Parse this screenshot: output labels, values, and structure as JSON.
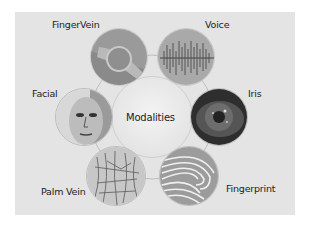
{
  "diagram": {
    "center": {
      "label": "Modalities"
    },
    "nodes": [
      {
        "id": "finger-vein",
        "label": "FingerVein",
        "image": "finger-vein-scan"
      },
      {
        "id": "voice",
        "label": "Voice",
        "image": "voice-waveform"
      },
      {
        "id": "facial",
        "label": "Facial",
        "image": "face-portrait"
      },
      {
        "id": "iris",
        "label": "Iris",
        "image": "iris-eye"
      },
      {
        "id": "palm-vein",
        "label": "Palm Vein",
        "image": "palm-vein-pattern"
      },
      {
        "id": "fingerprint",
        "label": "Fingerprint",
        "image": "fingerprint-ridges"
      }
    ]
  },
  "colors": {
    "panel_bg": "#e4e4e4",
    "circle_border": "#c8c8c8",
    "text": "#222222"
  }
}
